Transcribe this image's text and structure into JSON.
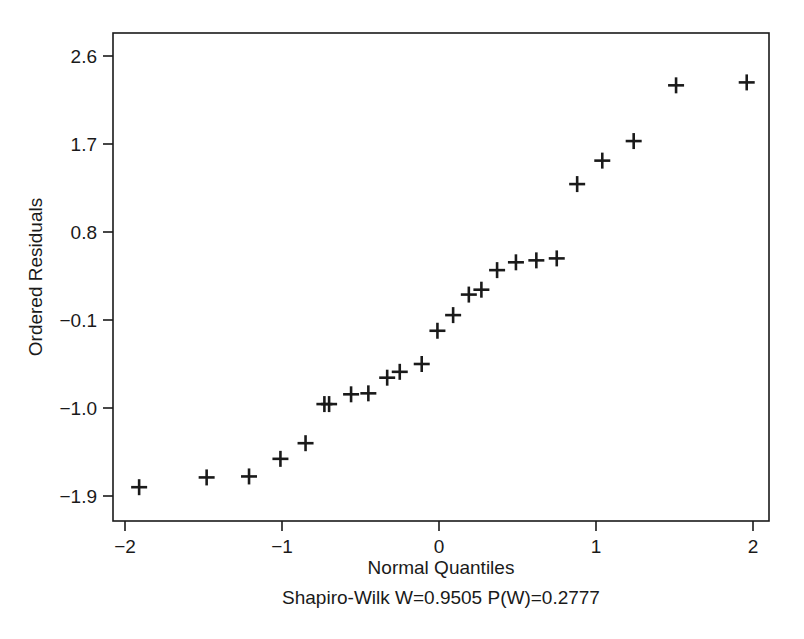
{
  "chart_data": {
    "type": "scatter",
    "title": "",
    "xlabel": "Normal Quantiles",
    "ylabel": "Ordered Residuals",
    "caption": "Shapiro-Wilk W=0.9505 P(W)=0.2777",
    "statistics": {
      "test_name": "Shapiro-Wilk",
      "W_label": "W=0.9505",
      "W": 0.9505,
      "P_label": "P(W)=0.2777",
      "P": 0.2777
    },
    "xlim": [
      -2.08,
      2.1
    ],
    "ylim": [
      -2.15,
      2.82
    ],
    "grid": false,
    "legend": null,
    "marker": "plus",
    "xticks": [
      -2,
      -1,
      0,
      1,
      2
    ],
    "xticklabels": [
      "−2",
      "−1",
      "0",
      "1",
      "2"
    ],
    "yticks": [
      2.6,
      1.7,
      0.8,
      -0.1,
      -1.0,
      -1.9
    ],
    "yticklabels": [
      "2.6",
      "1.7",
      "0.8",
      "−0.1",
      "−1.0",
      "−1.9"
    ],
    "x": [
      -1.91,
      -1.48,
      -1.21,
      -1.01,
      -0.85,
      -0.73,
      -0.7,
      -0.56,
      -0.45,
      -0.33,
      -0.25,
      -0.11,
      -0.01,
      0.09,
      0.19,
      0.27,
      0.37,
      0.49,
      0.62,
      0.75,
      0.88,
      1.04,
      1.24,
      1.51,
      1.96
    ],
    "y": [
      -1.81,
      -1.71,
      -1.7,
      -1.52,
      -1.36,
      -0.96,
      -0.96,
      -0.86,
      -0.85,
      -0.69,
      -0.63,
      -0.55,
      -0.21,
      -0.05,
      0.16,
      0.21,
      0.41,
      0.49,
      0.51,
      0.53,
      1.29,
      1.53,
      1.73,
      2.3,
      2.33
    ],
    "n_points": 25
  },
  "colors": {
    "ink": "#1a1a1a",
    "background": "#ffffff",
    "marker": "#1a1a1a"
  }
}
